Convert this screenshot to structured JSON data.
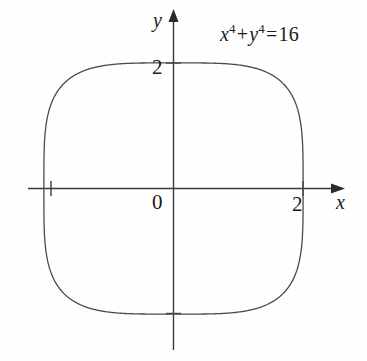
{
  "figure": {
    "background_color": "#fefefe",
    "ink_color": "#3a3a3a",
    "text_color": "#1b1b1b"
  },
  "labels": {
    "y_axis": "y",
    "x_axis": "x",
    "origin": "0",
    "y_tick_2": "2",
    "x_tick_2": "2"
  },
  "equation": {
    "x_var": "x",
    "x_exponent": "4",
    "plus": "+",
    "y_var": "y",
    "y_exponent": "4",
    "equals": "=",
    "rhs": "16",
    "plain_text": "x^4 + y^4 = 16"
  },
  "chart_data": {
    "type": "line",
    "title": "",
    "subtitle": "",
    "xlabel": "x",
    "ylabel": "y",
    "annotations": [
      "x^4 + y^4 = 16"
    ],
    "grid": false,
    "legend": null,
    "xlim": [
      -2.25,
      2.55
    ],
    "ylim": [
      -2.6,
      2.75
    ],
    "xticks": [
      -2,
      0,
      2
    ],
    "yticks": [
      -2,
      0,
      2
    ],
    "xtick_labels": [
      "",
      "0",
      "2"
    ],
    "ytick_labels": [
      "",
      "0",
      "2"
    ],
    "axis_arrows": {
      "x_positive": true,
      "y_positive": true
    },
    "curve": {
      "name": "x^4 + y^4 = 16",
      "implicit_equation": "x**4 + y**4 = 16",
      "closed": true,
      "vertices": [
        [
          2,
          0
        ],
        [
          0,
          2
        ],
        [
          -2,
          0
        ],
        [
          0,
          -2
        ]
      ],
      "x": [
        2.0,
        1.99,
        1.96,
        1.9,
        1.8,
        1.65,
        1.4,
        1.0,
        0.5,
        0.0,
        -0.5,
        -1.0,
        -1.4,
        -1.65,
        -1.8,
        -1.9,
        -1.96,
        -1.99,
        -2.0,
        -1.99,
        -1.96,
        -1.9,
        -1.8,
        -1.65,
        -1.4,
        -1.0,
        -0.5,
        0.0,
        0.5,
        1.0,
        1.4,
        1.65,
        1.8,
        1.9,
        1.96,
        1.99,
        2.0
      ],
      "y": [
        0.0,
        0.5,
        1.0,
        1.25,
        1.47,
        1.66,
        1.83,
        1.94,
        1.99,
        2.0,
        1.99,
        1.94,
        1.83,
        1.66,
        1.47,
        1.25,
        1.0,
        0.5,
        0.0,
        -0.5,
        -1.0,
        -1.25,
        -1.47,
        -1.66,
        -1.83,
        -1.94,
        -1.99,
        -2.0,
        -1.99,
        -1.94,
        -1.83,
        -1.66,
        -1.47,
        -1.25,
        -1.0,
        -0.5,
        0.0
      ]
    }
  }
}
